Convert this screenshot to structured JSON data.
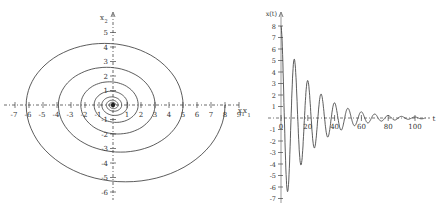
{
  "chart_data": [
    {
      "type": "line",
      "title": "",
      "subtitle": "phase portrait (spiral)",
      "xlabel": "x1",
      "ylabel": "x2",
      "xlim": [
        -7,
        9
      ],
      "ylim": [
        -6,
        5
      ],
      "grid": false,
      "x_ticks": [
        -7,
        -6,
        -5,
        -4,
        -3,
        -2,
        -1,
        1,
        2,
        3,
        4,
        5,
        6,
        7,
        8,
        9
      ],
      "y_ticks": [
        -6,
        -5,
        -4,
        -3,
        -2,
        -1,
        1,
        2,
        3,
        4,
        5
      ],
      "spiral_half_arcs": [
        {
          "from_x": 8.0,
          "to_x": -6.2,
          "extreme_y": -5.3
        },
        {
          "from_x": -6.2,
          "to_x": 5.0,
          "extreme_y": 4.25
        },
        {
          "from_x": 5.0,
          "to_x": -3.9,
          "extreme_y": -3.25
        },
        {
          "from_x": -3.9,
          "to_x": 3.0,
          "extreme_y": 2.6
        },
        {
          "from_x": 3.0,
          "to_x": -2.3,
          "extreme_y": -2.0
        },
        {
          "from_x": -2.3,
          "to_x": 1.8,
          "extreme_y": 1.6
        },
        {
          "from_x": 1.8,
          "to_x": -1.35,
          "extreme_y": -1.2
        },
        {
          "from_x": -1.35,
          "to_x": 1.05,
          "extreme_y": 0.95
        },
        {
          "from_x": 1.05,
          "to_x": -0.8,
          "extreme_y": -0.72
        },
        {
          "from_x": -0.8,
          "to_x": 0.62,
          "extreme_y": 0.56
        },
        {
          "from_x": 0.62,
          "to_x": -0.47,
          "extreme_y": -0.43
        },
        {
          "from_x": -0.47,
          "to_x": 0.36,
          "extreme_y": 0.33
        },
        {
          "from_x": 0.36,
          "to_x": -0.27,
          "extreme_y": -0.25
        },
        {
          "from_x": -0.27,
          "to_x": 0.2,
          "extreme_y": 0.19
        }
      ]
    },
    {
      "type": "line",
      "title": "",
      "subtitle": "time response",
      "xlabel": "t",
      "ylabel": "x(t)",
      "xlim": [
        0,
        110
      ],
      "ylim": [
        -7,
        8
      ],
      "grid": false,
      "x_ticks": [
        0,
        20,
        40,
        60,
        80,
        100
      ],
      "y_ticks": [
        -7,
        -6,
        -5,
        -4,
        -3,
        -2,
        -1,
        1,
        2,
        3,
        4,
        5,
        6,
        7,
        8
      ],
      "series": [
        {
          "name": "x(t)",
          "x0": 8,
          "decay_per_unit_t": 0.045,
          "period": 10.0,
          "extrema": [
            {
              "t": 0,
              "x": 8.0
            },
            {
              "t": 4.5,
              "x": -6.2
            },
            {
              "t": 9.5,
              "x": 5.0
            },
            {
              "t": 14.5,
              "x": -4.0
            },
            {
              "t": 19.5,
              "x": 3.1
            },
            {
              "t": 24.5,
              "x": -2.5
            },
            {
              "t": 29.5,
              "x": 2.0
            },
            {
              "t": 34.5,
              "x": -1.5
            },
            {
              "t": 40,
              "x": 1.3
            },
            {
              "t": 45,
              "x": -0.8
            },
            {
              "t": 50,
              "x": 0.8
            }
          ]
        }
      ]
    }
  ],
  "labels": {
    "left_x_axis": "x",
    "left_x_sub": "1",
    "left_y_axis": "x",
    "left_y_sub": "2",
    "right_y_axis": "x(t)",
    "right_x_axis": "t",
    "mid_label": "x",
    "mid_sub": "1"
  }
}
